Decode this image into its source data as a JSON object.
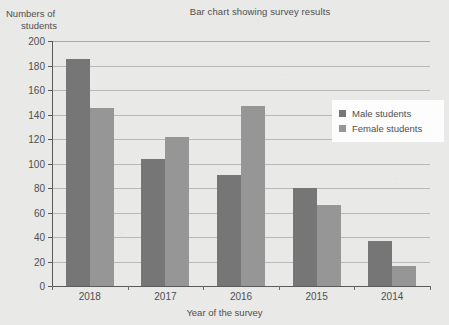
{
  "chart_data": {
    "type": "bar",
    "title": "Bar chart showing survey results",
    "xlabel": "Year of the survey",
    "ylabel": "Numbers of students",
    "ylabel_line1": "Numbers of",
    "ylabel_line2": "students",
    "categories": [
      "2018",
      "2017",
      "2016",
      "2015",
      "2014"
    ],
    "series": [
      {
        "name": "Male students",
        "color": "#767676",
        "values": [
          185,
          104,
          91,
          80,
          37
        ]
      },
      {
        "name": "Female students",
        "color": "#969696",
        "values": [
          145,
          122,
          147,
          66,
          16
        ]
      }
    ],
    "ylim": [
      0,
      200
    ],
    "ytick_step": 20,
    "yticks": [
      0,
      20,
      40,
      60,
      80,
      100,
      120,
      140,
      160,
      180,
      200
    ],
    "ytick_labels": [
      "0",
      "20",
      "40",
      "60",
      "80",
      "100",
      "120",
      "140",
      "160",
      "180",
      "200"
    ],
    "grid": true,
    "grid_axis": "y",
    "legend_position": "right",
    "background_color": "#e9e9e7",
    "gridline_color": "#b9b9b9",
    "axis_color": "#5a5a5a",
    "text_color": "#4f4f4f"
  }
}
